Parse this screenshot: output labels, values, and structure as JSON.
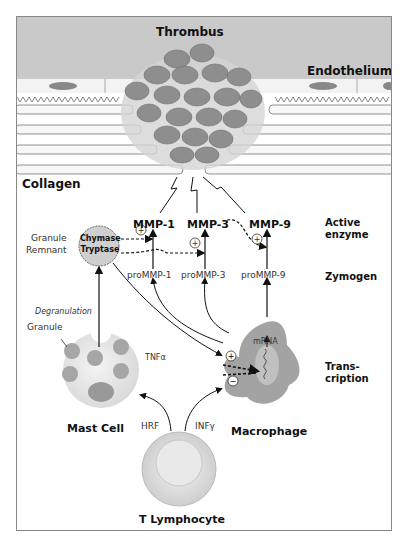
{
  "diagram": {
    "title_labels": {
      "thrombus": "Thrombus",
      "endothelium": "Endothelium",
      "collagen": "Collagen"
    },
    "enzymes": {
      "active": [
        "MMP-1",
        "MMP-3",
        "MMP-9"
      ],
      "zymogens": [
        "proMMP-1",
        "proMMP-3",
        "proMMP-9"
      ]
    },
    "stage_labels": {
      "active_enzyme_line1": "Active",
      "active_enzyme_line2": "enzyme",
      "zymogen": "Zymogen",
      "transcription_line1": "Trans-",
      "transcription_line2": "cription"
    },
    "granule_remnant": {
      "label_line1": "Granule",
      "label_line2": "Remnant",
      "content_line1": "Chymase",
      "content_line2": "Tryptase"
    },
    "cells": {
      "mast_cell": "Mast Cell",
      "macrophage": "Macrophage",
      "t_lymphocyte": "T Lymphocyte"
    },
    "annotations": {
      "degranulation": "Degranulation",
      "granule": "Granule",
      "mrna": "mRNA",
      "tnf": "TNFα",
      "hrf": "HRF",
      "inf": "INFγ",
      "plus": "+",
      "minus": "−"
    },
    "colors": {
      "lumen": "#c8c8c8",
      "cell_fill": "#9a9a9a",
      "light_cell": "#e8e8e8",
      "granule_fill": "#a8a8a8",
      "frame": "#888888",
      "text": "#111111"
    }
  }
}
